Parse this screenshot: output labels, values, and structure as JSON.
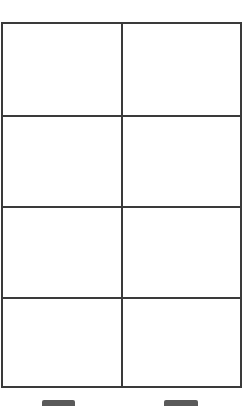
{
  "document": {
    "type": "blank-table-form",
    "grid": {
      "rows": 4,
      "columns": 2,
      "border_color": "#3a3a3a",
      "cells": [
        [
          "",
          ""
        ],
        [
          "",
          ""
        ],
        [
          "",
          ""
        ],
        [
          "",
          ""
        ]
      ]
    },
    "footer_tabs": [
      {
        "color": "#5a5a5a"
      },
      {
        "color": "#5a5a5a"
      }
    ],
    "background": "#ffffff"
  }
}
